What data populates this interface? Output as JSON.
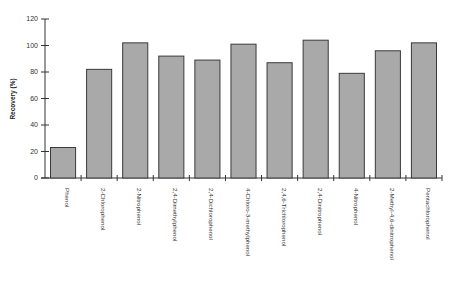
{
  "chart_data": {
    "type": "bar",
    "title": "",
    "xlabel": "",
    "ylabel": "Recovery (%)",
    "ylim": [
      0,
      120
    ],
    "yticks": [
      0,
      20,
      40,
      60,
      80,
      100,
      120
    ],
    "grid": false,
    "legend": null,
    "categories": [
      "Phenol",
      "2-Chlorophenol",
      "2-Nitrophenol",
      "2,4-Dimethylphenol",
      "2,4-Dichlorophenol",
      "4-Chloro-3-methylphenol",
      "2,4,6-Trichlorophenol",
      "2,4-Dinitrophenol",
      "4-Nitrophenol",
      "2-Methyl-4,6-dinitrophenol",
      "Pentachlorophenol"
    ],
    "values": [
      23,
      82,
      102,
      92,
      89,
      101,
      87,
      104,
      79,
      96,
      102
    ],
    "colors": {
      "bar_fill": "#a9a9a9",
      "bar_stroke": "#3a3a3a",
      "axis": "#333333"
    }
  }
}
